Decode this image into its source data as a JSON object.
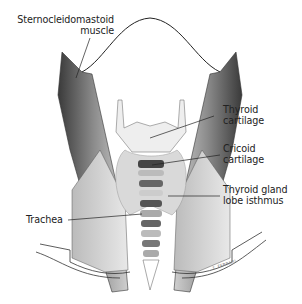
{
  "figure": {
    "signature": "T. FERRARI"
  },
  "labels": [
    {
      "id": "scm",
      "line1": "Sternocleidomastoid",
      "line2": "muscle"
    },
    {
      "id": "thyroid_cartilage",
      "line1": "Thyroid",
      "line2": "cartilage"
    },
    {
      "id": "cricoid_cartilage",
      "line1": "Cricoid",
      "line2": "cartilage"
    },
    {
      "id": "thyroid_gland",
      "line1": "Thyroid gland",
      "line2": "lobe isthmus"
    },
    {
      "id": "trachea",
      "line1": "Trachea",
      "line2": ""
    }
  ]
}
